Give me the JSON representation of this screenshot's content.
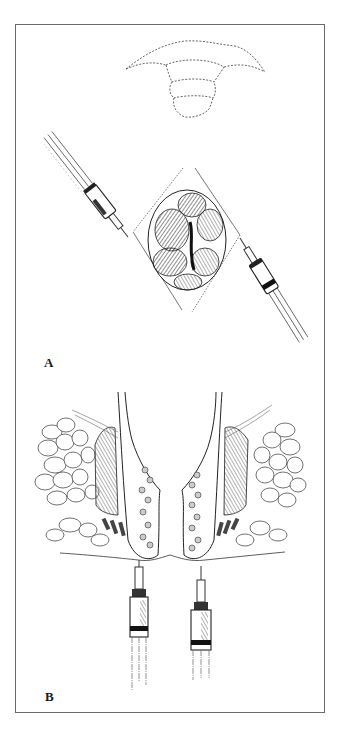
{
  "figure": {
    "panels": [
      {
        "label": "A",
        "description": "Dashed outline of gluteal/perianal region at top; below, a lobulated mass (hemorrhoid) outlined by a dashed diamond-shaped incision with two syringes injecting local anesthetic from upper-left and lower-right."
      },
      {
        "label": "B",
        "description": "Coronal cross-section of the anal canal showing sphincter muscles, ischiorectal fat lobules on both sides, and two syringes injecting from below into the perianal tissue."
      }
    ],
    "colors": {
      "ink": "#1a1a1a",
      "frame": "#6a6a6a",
      "muscle": "#7a7a7a",
      "background": "#ffffff"
    }
  }
}
